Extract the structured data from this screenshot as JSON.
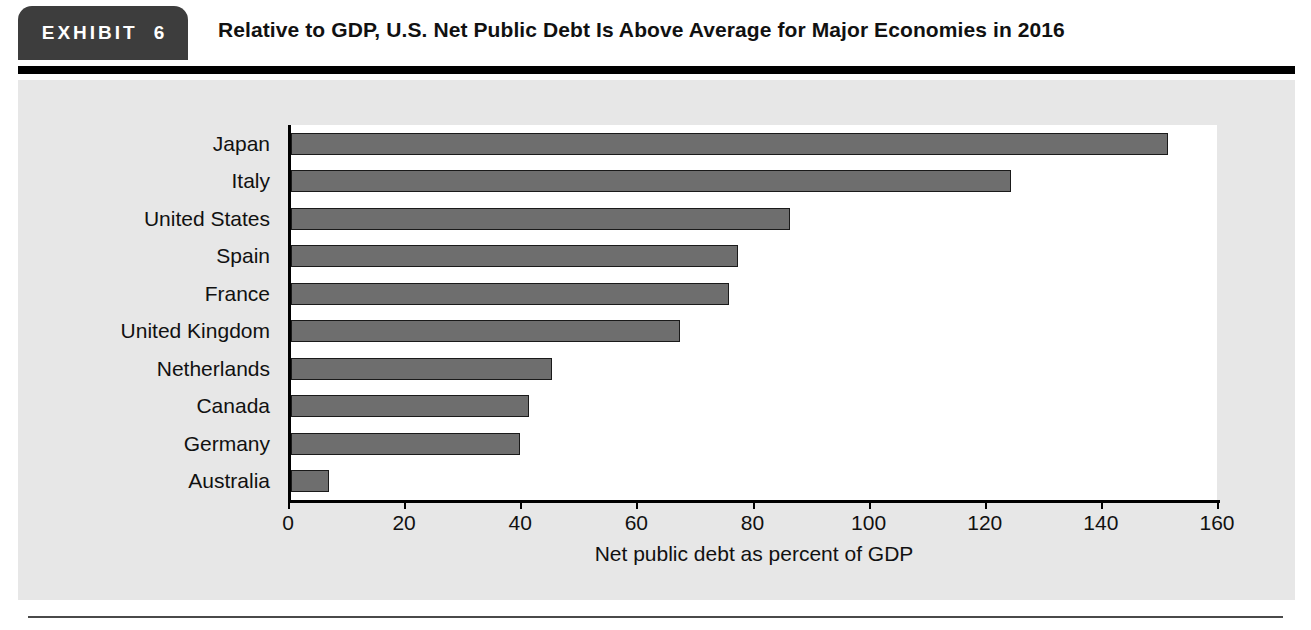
{
  "exhibit": {
    "badge_word": "EXHIBIT",
    "badge_number": "6",
    "title": "Relative to GDP, U.S. Net Public Debt Is Above Average for Major Economies in 2016"
  },
  "colors": {
    "badge_background": "#3d3d3d",
    "panel_background": "#e7e7e7",
    "plot_background": "#ffffff",
    "bar_fill": "#6e6e6e",
    "bar_outline": "#1a1a1a",
    "rule": "#000000"
  },
  "chart_data": {
    "type": "bar",
    "orientation": "horizontal",
    "title": "Relative to GDP, U.S. Net Public Debt Is Above Average for Major Economies in 2016",
    "categories": [
      "Japan",
      "Italy",
      "United States",
      "Spain",
      "France",
      "United Kingdom",
      "Netherlands",
      "Canada",
      "Germany",
      "Australia"
    ],
    "values": [
      151,
      124,
      86,
      77,
      75.5,
      67,
      45,
      41,
      39.5,
      6.5
    ],
    "xlabel": "Net public debt as percent of GDP",
    "ylabel": "",
    "xlim": [
      0,
      160
    ],
    "xticks": [
      0,
      20,
      40,
      60,
      80,
      100,
      120,
      140,
      160
    ],
    "xtick_labels": [
      "0",
      "20",
      "40",
      "60",
      "80",
      "100",
      "120",
      "140",
      "160"
    ],
    "grid": false,
    "legend": false
  }
}
